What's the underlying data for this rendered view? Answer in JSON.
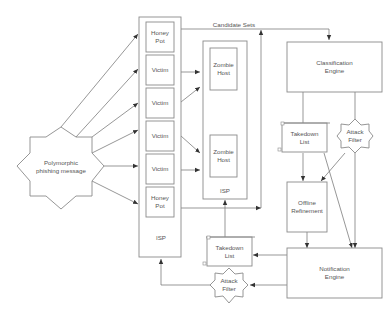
{
  "diagram": {
    "nodes": {
      "phishing": {
        "line1": "Polymorphic",
        "line2": "phishing message"
      },
      "isp_left": {
        "label": "ISP"
      },
      "honeypot_top": {
        "line1": "Honey",
        "line2": "Pot"
      },
      "victim1": {
        "label": "Victim"
      },
      "victim2": {
        "label": "Victim"
      },
      "victim3": {
        "label": "Victim"
      },
      "victim4": {
        "label": "Victim"
      },
      "honeypot_bottom": {
        "line1": "Honey",
        "line2": "Pot"
      },
      "isp_mid": {
        "label": "ISP"
      },
      "zombie1": {
        "line1": "Zombie",
        "line2": "Host"
      },
      "zombie2": {
        "line1": "Zombie",
        "line2": "Host"
      },
      "classification": {
        "line1": "Classification",
        "line2": "Engine"
      },
      "takedown_upper": {
        "line1": "Takedown",
        "line2": "List"
      },
      "attack_filter_upper": {
        "line1": "Attack",
        "line2": "Filter"
      },
      "offline": {
        "line1": "Offline",
        "line2": "Refinement"
      },
      "notification": {
        "line1": "Notification",
        "line2": "Engine"
      },
      "takedown_lower": {
        "line1": "Takedown",
        "line2": "List"
      },
      "attack_filter_lower": {
        "line1": "Attack",
        "line2": "Filter"
      }
    },
    "edge_labels": {
      "candidate_sets": "Candidate Sets"
    }
  }
}
